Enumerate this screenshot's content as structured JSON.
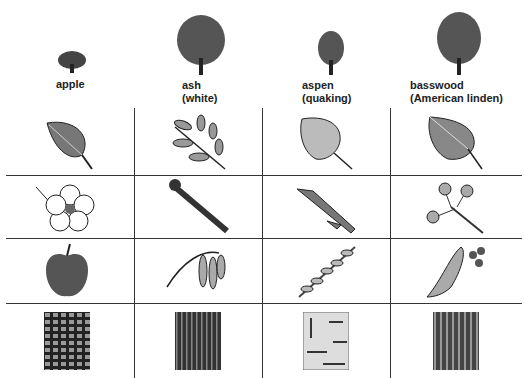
{
  "columns": [
    {
      "name": "apple",
      "sub": ""
    },
    {
      "name": "ash",
      "sub": "(white)"
    },
    {
      "name": "aspen",
      "sub": "(quaking)"
    },
    {
      "name": "basswood",
      "sub": "(American linden)"
    }
  ],
  "rows": [
    "leaf",
    "flower-or-bud",
    "fruit-or-seed",
    "bark"
  ],
  "colors": {
    "line": "#333333",
    "ink": "#222222",
    "leaf_fill": "#8a8a8a",
    "light_fill": "#c8c8c8"
  }
}
